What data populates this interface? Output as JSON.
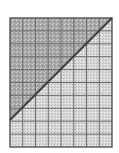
{
  "figure": {
    "grid": {
      "columns": 8,
      "rows": 10
    },
    "box": {
      "x": 10,
      "y": 18,
      "width": 102,
      "height": 129
    },
    "diagonal": {
      "x1": 10,
      "y1": 120,
      "x2": 112,
      "y2": 18
    },
    "colors": {
      "upper_fill": "#a9a9a9",
      "lower_fill": "#d6d6d6",
      "grid_line": "#6e6e6e",
      "border": "#555555",
      "diagonal": "#3a3a3a",
      "background": "#ffffff"
    }
  }
}
